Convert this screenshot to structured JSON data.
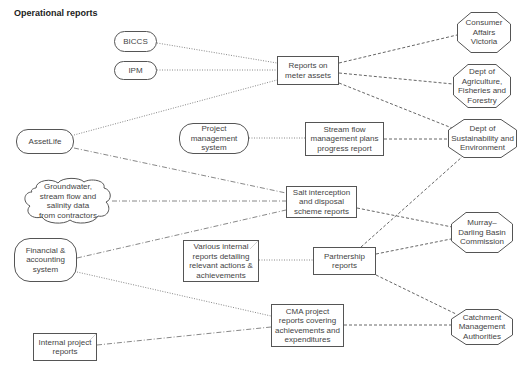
{
  "title": "Operational reports",
  "sources": {
    "biccs": "BICCS",
    "ipm": "IPM",
    "assetlife": "AssetLife",
    "project_mgmt": [
      "Project",
      "management",
      "system"
    ],
    "groundwater": [
      "Groundwater,",
      "stream flow and",
      "salinity data",
      "from contractors"
    ],
    "financial": [
      "Financial &",
      "accounting",
      "system"
    ],
    "internal_project": [
      "Internal project",
      "reports"
    ]
  },
  "reports": {
    "meter_assets": [
      "Reports on",
      "meter assets"
    ],
    "stream_flow": [
      "Stream flow",
      "management plans",
      "progress report"
    ],
    "salt_interception": [
      "Salt interception",
      "and disposal",
      "scheme reports"
    ],
    "various_internal": [
      "Various internal",
      "reports detailing",
      "relevant actions &",
      "achievements"
    ],
    "partnership": [
      "Partnership",
      "reports"
    ],
    "cma_project": [
      "CMA project",
      "reports covering",
      "achievements and",
      "expenditures"
    ]
  },
  "recipients": {
    "consumer_affairs": [
      "Consumer",
      "Affairs",
      "Victoria"
    ],
    "dept_agri": [
      "Dept of",
      "Agriculture,",
      "Fisheries and",
      "Forestry"
    ],
    "dse": [
      "Dept of",
      "Sustainability and",
      "Environment"
    ],
    "murray_darling": [
      "Murray–",
      "Darling Basin",
      "Commission"
    ],
    "catchment": [
      "Catchment",
      "Management",
      "Authorities"
    ]
  },
  "colors": {
    "stroke": "#555555",
    "edge": "#777777",
    "text": "#444444"
  }
}
